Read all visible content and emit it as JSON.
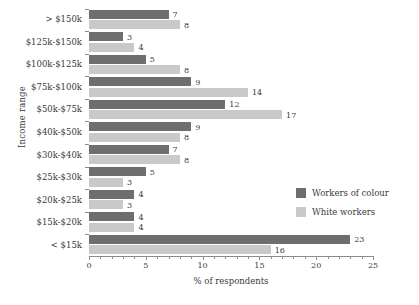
{
  "chart_data": {
    "type": "bar",
    "orientation": "horizontal",
    "title": "",
    "xlabel": "% of respondents",
    "ylabel": "Income range",
    "xlim": [
      0,
      25
    ],
    "xticks": [
      0,
      5,
      10,
      15,
      20,
      25
    ],
    "xtick_labels": [
      "0",
      "5",
      "10",
      "15",
      "20",
      "25"
    ],
    "minor_tick_step": 1,
    "grid": false,
    "legend_position": "right",
    "categories": [
      "> $150k",
      "$125k-$150k",
      "$100k-$125k",
      "$75k-$100k",
      "$50k-$75k",
      "$40k-$50k",
      "$30k-$40k",
      "$25k-$30k",
      "$20k-$25k",
      "$15k-$20k",
      "< $15k"
    ],
    "series": [
      {
        "name": "Workers of colour",
        "color": "#6e6e6e",
        "values": [
          7,
          3,
          5,
          9,
          12,
          9,
          7,
          5,
          4,
          4,
          23
        ]
      },
      {
        "name": "White workers",
        "color": "#c9c9c9",
        "values": [
          8,
          4,
          8,
          14,
          17,
          8,
          8,
          3,
          3,
          4,
          16
        ]
      }
    ]
  },
  "colors": {
    "dark": "#6e6e6e",
    "light": "#c9c9c9",
    "axis": "#8d8d8d",
    "text": "#3a3a3a",
    "background": "#ffffff"
  }
}
